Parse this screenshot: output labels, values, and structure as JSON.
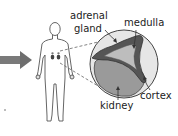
{
  "diagram": {
    "labels": {
      "adrenal_line1": "adrenal",
      "adrenal_line2": "gland",
      "medulla": "medulla",
      "cortex": "cortex",
      "kidney": "kidney"
    },
    "colors": {
      "arrow": "#6e6e6e",
      "outline": "#4a4a4a",
      "cortex_fill": "#5a5a5a",
      "medulla_fill": "#bdbdbd",
      "kidney_fill": "#9a9a9a",
      "circle_bg": "#e2e2e2",
      "organ_dots": "#444444"
    }
  }
}
